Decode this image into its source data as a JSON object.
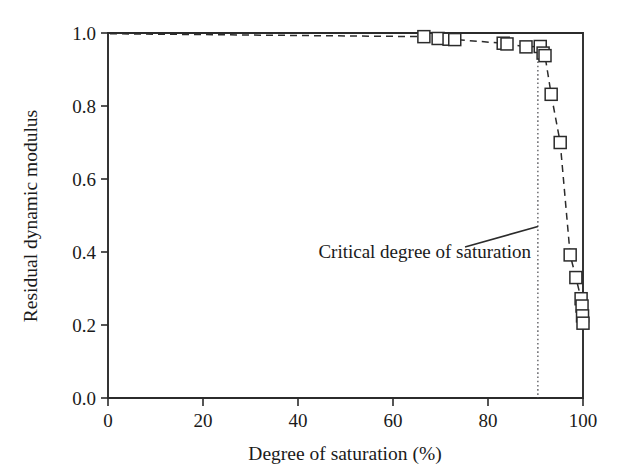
{
  "chart_data": {
    "type": "scatter",
    "title": "",
    "xlabel": "Degree of saturation (%)",
    "ylabel": "Residual dynamic modulus",
    "xlim": [
      0,
      100
    ],
    "ylim": [
      0.0,
      1.0
    ],
    "xticks": [
      0,
      20,
      40,
      60,
      80,
      100
    ],
    "xtick_labels": [
      "0",
      "20",
      "40",
      "60",
      "80",
      "100"
    ],
    "yticks": [
      0.0,
      0.2,
      0.4,
      0.6,
      0.8,
      1.0
    ],
    "ytick_labels": [
      "0.0",
      "0.2",
      "0.4",
      "0.6",
      "0.8",
      "1.0"
    ],
    "grid": false,
    "legend": null,
    "marker_style": "open-square",
    "line_style": "dashed",
    "series": [
      {
        "name": "Residual dynamic modulus",
        "x": [
          66.5,
          69.5,
          71.8,
          73.0,
          83.2,
          84.0,
          88.0,
          91.0,
          91.6,
          92.0,
          93.3,
          95.2,
          97.3,
          98.5,
          99.6,
          99.8,
          99.9,
          100.0
        ],
        "y": [
          0.99,
          0.985,
          0.983,
          0.982,
          0.972,
          0.97,
          0.962,
          0.963,
          0.945,
          0.938,
          0.832,
          0.7,
          0.392,
          0.33,
          0.272,
          0.252,
          0.225,
          0.205
        ]
      }
    ],
    "annotations": [
      {
        "text": "Critical degree of saturation",
        "x": 90.5,
        "y": 0.47,
        "pointer": "leader-line to critical saturation line"
      }
    ],
    "reference_lines": [
      {
        "name": "critical-degree-of-saturation",
        "orientation": "vertical",
        "value": 90.5,
        "style": "dotted"
      }
    ],
    "colors": {
      "axis": "#2b2b2b",
      "marker_face": "#ffffff",
      "marker_edge": "#2b2b2b",
      "line": "#2b2b2b",
      "reference_line": "#55555a",
      "background": "#ffffff"
    }
  }
}
